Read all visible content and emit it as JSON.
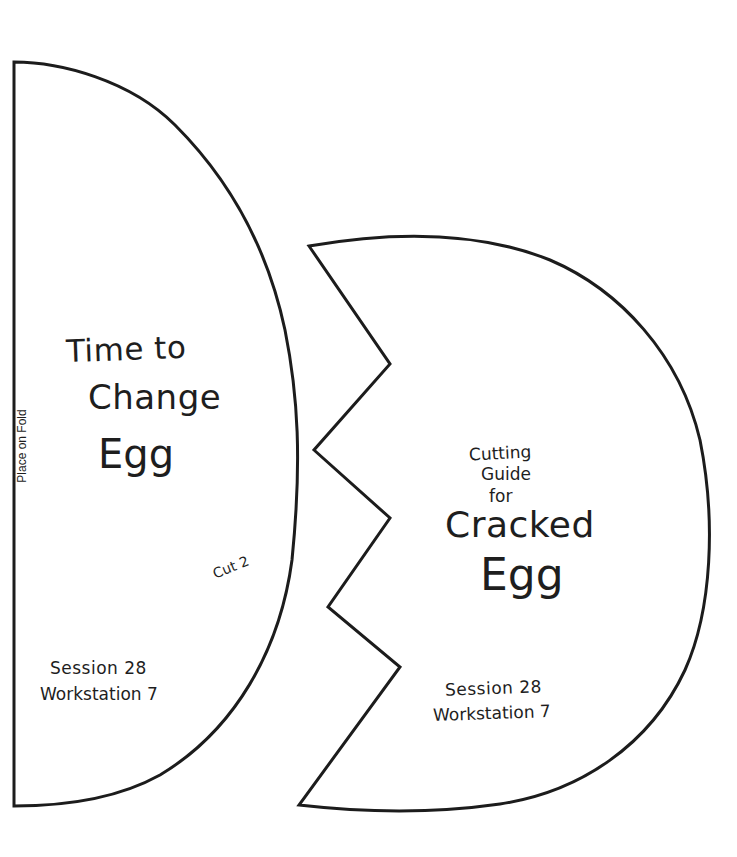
{
  "document": {
    "type": "craft-cutting-template",
    "background_color": "#ffffff",
    "line_color": "#1c1c1c"
  },
  "left_piece": {
    "name": "Time to Change Egg",
    "title_lines": [
      "Time to",
      "Change",
      "Egg"
    ],
    "fold_label": "Place on Fold",
    "cut_instruction": "Cut 2",
    "session_label": "Session 28",
    "workstation_label": "Workstation 7"
  },
  "right_piece": {
    "name": "Cutting Guide for Cracked Egg",
    "subtitle_lines": [
      "Cutting",
      "Guide",
      "for"
    ],
    "title_lines": [
      "Cracked",
      "Egg"
    ],
    "session_label": "Session 28",
    "workstation_label": "Workstation 7"
  }
}
